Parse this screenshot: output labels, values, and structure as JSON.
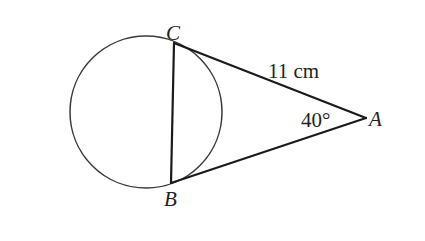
{
  "diagram": {
    "type": "geometry",
    "colors": {
      "background": "#ffffff",
      "line": "#1a1a1a",
      "circle": "#3a3a3a",
      "text": "#222222"
    },
    "circle": {
      "cx": 146,
      "cy": 112,
      "r": 76
    },
    "points": {
      "C": {
        "label": "C",
        "x": 174,
        "y": 43
      },
      "B": {
        "label": "B",
        "x": 171,
        "y": 183
      },
      "A": {
        "label": "A",
        "x": 366,
        "y": 118
      }
    },
    "segments": [
      {
        "from": "C",
        "to": "A",
        "name": "tangent-CA"
      },
      {
        "from": "B",
        "to": "A",
        "name": "tangent-BA"
      },
      {
        "from": "C",
        "to": "B",
        "name": "chord-CB"
      }
    ],
    "labels": {
      "length_CA": "11 cm",
      "angle_A": "40°",
      "point_C": "C",
      "point_B": "B",
      "point_A": "A"
    }
  }
}
